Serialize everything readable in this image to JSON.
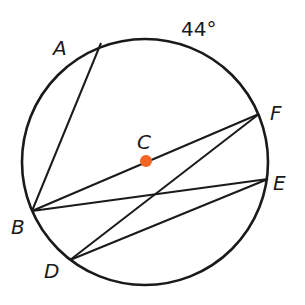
{
  "diagram": {
    "type": "circle-geometry",
    "circle": {
      "center": "C",
      "cx": 145,
      "cy": 162,
      "r": 123
    },
    "center_color": "#f26522",
    "stroke_color": "#1a1a1a",
    "points": {
      "A": {
        "label": "A",
        "x": 101,
        "y": 43
      },
      "F": {
        "label": "F",
        "x": 259,
        "y": 114
      },
      "E": {
        "label": "E",
        "x": 268,
        "y": 179
      },
      "B": {
        "label": "B",
        "x": 32,
        "y": 211
      },
      "D": {
        "label": "D",
        "x": 70,
        "y": 260
      },
      "C": {
        "label": "C",
        "x": 146,
        "y": 161
      }
    },
    "segments": [
      {
        "from": "A",
        "to": "B"
      },
      {
        "from": "B",
        "to": "F"
      },
      {
        "from": "B",
        "to": "E"
      },
      {
        "from": "D",
        "to": "F"
      },
      {
        "from": "D",
        "to": "E"
      }
    ],
    "arc_annotation": {
      "arc": "AF",
      "label": "44°"
    }
  }
}
